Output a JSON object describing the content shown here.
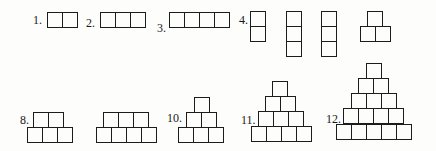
{
  "figures": [
    {
      "id": "fig-1",
      "label": "1.",
      "label_pos": [
        33,
        14
      ],
      "rows": [
        {
          "x": 47,
          "y": 12,
          "n": 2
        }
      ]
    },
    {
      "id": "fig-2",
      "label": "2.",
      "label_pos": [
        86,
        17
      ],
      "rows": [
        {
          "x": 100,
          "y": 12,
          "n": 3
        }
      ]
    },
    {
      "id": "fig-3",
      "label": "3.",
      "label_pos": [
        157,
        22
      ],
      "rows": [
        {
          "x": 169,
          "y": 12,
          "n": 4
        }
      ]
    },
    {
      "id": "fig-4a",
      "label": "4.",
      "label_pos": [
        239,
        14
      ],
      "columns": [
        {
          "x": 250,
          "y": 11,
          "n": 2
        }
      ]
    },
    {
      "id": "fig-4b",
      "label": "",
      "columns": [
        {
          "x": 286,
          "y": 11,
          "n": 3
        }
      ]
    },
    {
      "id": "fig-4c",
      "label": "",
      "columns": [
        {
          "x": 321,
          "y": 11,
          "n": 3
        }
      ]
    },
    {
      "id": "fig-4d",
      "label": "",
      "rows": [
        {
          "x": 367,
          "y": 11,
          "n": 1
        },
        {
          "x": 360,
          "y": 26,
          "n": 2
        }
      ]
    },
    {
      "id": "fig-8",
      "label": "8.",
      "label_pos": [
        20,
        114
      ],
      "rows": [
        {
          "x": 33,
          "y": 112,
          "n": 2
        },
        {
          "x": 27,
          "y": 127,
          "n": 3
        }
      ]
    },
    {
      "id": "fig-9",
      "label": "",
      "rows": [
        {
          "x": 103,
          "y": 112,
          "n": 3
        },
        {
          "x": 96,
          "y": 127,
          "n": 4
        }
      ]
    },
    {
      "id": "fig-10",
      "label": "10.",
      "label_pos": [
        167,
        112
      ],
      "rows": [
        {
          "x": 194,
          "y": 97,
          "n": 1
        },
        {
          "x": 186,
          "y": 112,
          "n": 2
        },
        {
          "x": 178,
          "y": 127,
          "n": 3
        }
      ]
    },
    {
      "id": "fig-11",
      "label": "11.",
      "label_pos": [
        241,
        114
      ],
      "rows": [
        {
          "x": 272,
          "y": 81,
          "n": 1
        },
        {
          "x": 265,
          "y": 96,
          "n": 2
        },
        {
          "x": 258,
          "y": 111,
          "n": 3
        },
        {
          "x": 251,
          "y": 126,
          "n": 4
        }
      ]
    },
    {
      "id": "fig-12",
      "label": "12.",
      "label_pos": [
        326,
        113
      ],
      "rows": [
        {
          "x": 366,
          "y": 63,
          "n": 1
        },
        {
          "x": 358,
          "y": 78,
          "n": 2
        },
        {
          "x": 351,
          "y": 93,
          "n": 3
        },
        {
          "x": 343,
          "y": 108,
          "n": 4
        },
        {
          "x": 336,
          "y": 124,
          "n": 5
        }
      ]
    }
  ],
  "cell_size": 15,
  "colors": {
    "stroke": "#1c1c1c",
    "background": "#fdfdfc",
    "text": "#1a1a1a"
  }
}
